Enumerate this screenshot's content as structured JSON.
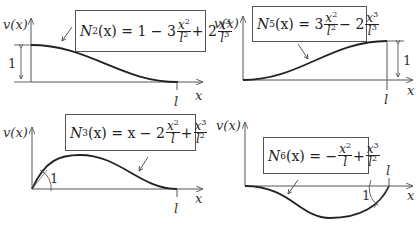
{
  "panels": [
    {
      "id": "N2",
      "axis_y_label": "v(x)",
      "axis_x_label": "x",
      "tick_label": "l",
      "dimension_label": "1",
      "equation": {
        "lhs_name": "N",
        "lhs_sub": "2",
        "lhs_arg": "(x)",
        "text": "N2(x) = 1 − 3 x²/l² + 2 x³/l³"
      },
      "eq_parts": {
        "c0": "= 1 − 3",
        "n1": "x",
        "n1e": "2",
        "d1": "l",
        "d1e": "2",
        "op": "+ 2",
        "n2": "x",
        "n2e": "3",
        "d2": "l",
        "d2e": "3"
      }
    },
    {
      "id": "N5",
      "axis_y_label": "v(x)",
      "axis_x_label": "x",
      "tick_label": "l",
      "dimension_label": "1",
      "equation": {
        "lhs_name": "N",
        "lhs_sub": "5",
        "lhs_arg": "(x)",
        "text": "N5(x) = 3 x²/l² − 2 x³/l³"
      },
      "eq_parts": {
        "c0": "= 3",
        "n1": "x",
        "n1e": "2",
        "d1": "l",
        "d1e": "2",
        "op": "− 2",
        "n2": "x",
        "n2e": "3",
        "d2": "l",
        "d2e": "3"
      }
    },
    {
      "id": "N3",
      "axis_y_label": "v(x)",
      "axis_x_label": "x",
      "tick_label": "l",
      "slope_label": "1",
      "equation": {
        "lhs_name": "N",
        "lhs_sub": "3",
        "lhs_arg": "(x)",
        "text": "N3(x) = x − 2 x²/l + x³/l²"
      },
      "eq_parts": {
        "c0": "= x − 2",
        "n1": "x",
        "n1e": "2",
        "d1": "l",
        "d1e": "",
        "op": "+",
        "n2": "x",
        "n2e": "3",
        "d2": "l",
        "d2e": "2"
      }
    },
    {
      "id": "N6",
      "axis_y_label": "v(x)",
      "axis_x_label": "x",
      "tick_label": "l",
      "slope_label": "1",
      "equation": {
        "lhs_name": "N",
        "lhs_sub": "6",
        "lhs_arg": "(x)",
        "text": "N6(x) = − x²/l + x³/l²"
      },
      "eq_parts": {
        "c0": "= −",
        "n1": "x",
        "n1e": "2",
        "d1": "l",
        "d1e": "",
        "op": "+",
        "n2": "x",
        "n2e": "3",
        "d2": "l",
        "d2e": "2"
      }
    }
  ]
}
